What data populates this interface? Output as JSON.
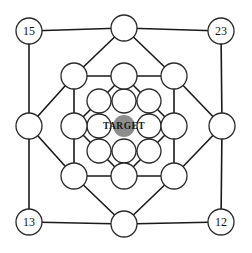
{
  "figure": {
    "name": "concentric-square-node-graph",
    "center": {
      "x": 124,
      "y": 126
    },
    "background_color": "#ffffff",
    "line_color": "#1a1a1a",
    "node_fill_color": "#ffffff",
    "node_stroke_color": "#2a2a2a"
  },
  "target": {
    "label": "TARGET",
    "marker_color": "#8d8d8d",
    "marker_radius": 11,
    "x": 124,
    "y": 126
  },
  "rings": [
    {
      "name": "outer-ring",
      "index": 0,
      "half_size": 95,
      "node_radius": 13,
      "nodes": [
        {
          "position": "top-left",
          "x": 29,
          "y": 31,
          "label": "15"
        },
        {
          "position": "top-center",
          "x": 124,
          "y": 28,
          "label": ""
        },
        {
          "position": "top-right",
          "x": 221,
          "y": 31,
          "label": "23"
        },
        {
          "position": "middle-right",
          "x": 222,
          "y": 126,
          "label": ""
        },
        {
          "position": "bottom-right",
          "x": 221,
          "y": 222,
          "label": "12"
        },
        {
          "position": "bottom-center",
          "x": 124,
          "y": 224,
          "label": ""
        },
        {
          "position": "bottom-left",
          "x": 29,
          "y": 222,
          "label": "13"
        },
        {
          "position": "middle-left",
          "x": 29,
          "y": 126,
          "label": ""
        }
      ]
    },
    {
      "name": "second-ring",
      "index": 1,
      "half_size": 50,
      "node_radius": 13,
      "nodes": [
        {
          "position": "top-left",
          "x": 74,
          "y": 76,
          "label": ""
        },
        {
          "position": "top-center",
          "x": 124,
          "y": 76,
          "label": ""
        },
        {
          "position": "top-right",
          "x": 174,
          "y": 76,
          "label": ""
        },
        {
          "position": "middle-right",
          "x": 174,
          "y": 126,
          "label": ""
        },
        {
          "position": "bottom-right",
          "x": 174,
          "y": 176,
          "label": ""
        },
        {
          "position": "bottom-center",
          "x": 124,
          "y": 176,
          "label": ""
        },
        {
          "position": "bottom-left",
          "x": 74,
          "y": 176,
          "label": ""
        },
        {
          "position": "middle-left",
          "x": 74,
          "y": 126,
          "label": ""
        }
      ]
    },
    {
      "name": "third-ring",
      "index": 2,
      "half_size": 25,
      "node_radius": 12,
      "nodes": [
        {
          "position": "top-left",
          "x": 99,
          "y": 101,
          "label": ""
        },
        {
          "position": "top-center",
          "x": 124,
          "y": 101,
          "label": ""
        },
        {
          "position": "top-right",
          "x": 149,
          "y": 101,
          "label": ""
        },
        {
          "position": "middle-right",
          "x": 149,
          "y": 126,
          "label": ""
        },
        {
          "position": "bottom-right",
          "x": 149,
          "y": 151,
          "label": ""
        },
        {
          "position": "bottom-center",
          "x": 124,
          "y": 151,
          "label": ""
        },
        {
          "position": "bottom-left",
          "x": 99,
          "y": 151,
          "label": ""
        },
        {
          "position": "middle-left",
          "x": 99,
          "y": 126,
          "label": ""
        }
      ]
    }
  ],
  "edges": {
    "ring_edges_note": "square perimeter segments joining the 8 nodes of each ring",
    "spoke_edges_note": "radial connectors from each outer corner to the matching inner corner and from each edge midpoint inward"
  },
  "corner_labels": [
    "15",
    "23",
    "12",
    "13"
  ]
}
